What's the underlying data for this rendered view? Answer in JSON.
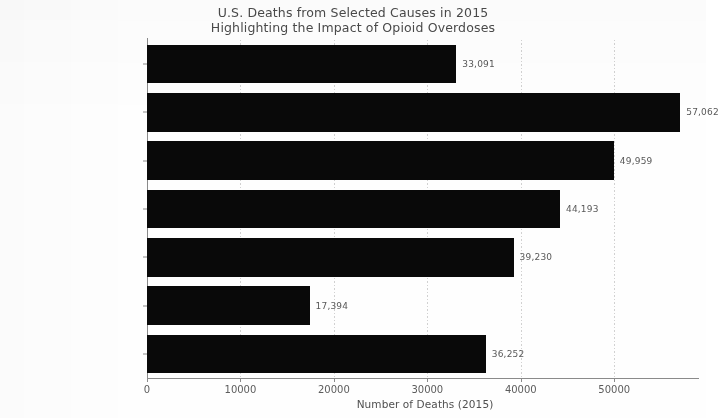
{
  "chart_data": {
    "type": "bar",
    "orientation": "horizontal",
    "title": "U.S. Deaths from Selected Causes in 2015",
    "subtitle": "Highlighting the Impact of Opioid Overdoses",
    "xlabel": "Number of Deaths (2015)",
    "ylabel": "",
    "categories": [
      "Opioid Overdoses",
      "Influenza & Pneumonia",
      "Kidney Disease",
      "Suicide",
      "Liver Disease",
      "Homicide",
      "Firearm Deaths"
    ],
    "values": [
      33091,
      57062,
      49959,
      44193,
      39230,
      17394,
      36252
    ],
    "value_labels": [
      "33,091",
      "57,062",
      "49,959",
      "44,193",
      "39,230",
      "17,394",
      "36,252"
    ],
    "xlim": [
      0,
      59500
    ],
    "xticks": [
      0,
      10000,
      20000,
      30000,
      40000,
      50000
    ],
    "xtick_labels": [
      "0",
      "10000",
      "20000",
      "30000",
      "40000",
      "50000"
    ],
    "grid": true,
    "grid_axis": "x",
    "legend": null,
    "bar_color": "#090909",
    "grid_color": "#c9c9c9",
    "text_color": "#5c5c5c",
    "background_color": "#fefefe"
  }
}
